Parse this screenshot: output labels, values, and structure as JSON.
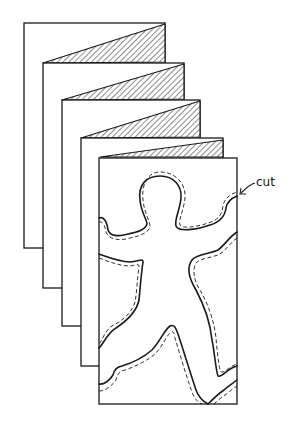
{
  "figure": {
    "panel_count": 5,
    "annotation": {
      "label": "cut"
    },
    "colors": {
      "ink": "#1a1a1a",
      "paper": "#ffffff"
    }
  }
}
